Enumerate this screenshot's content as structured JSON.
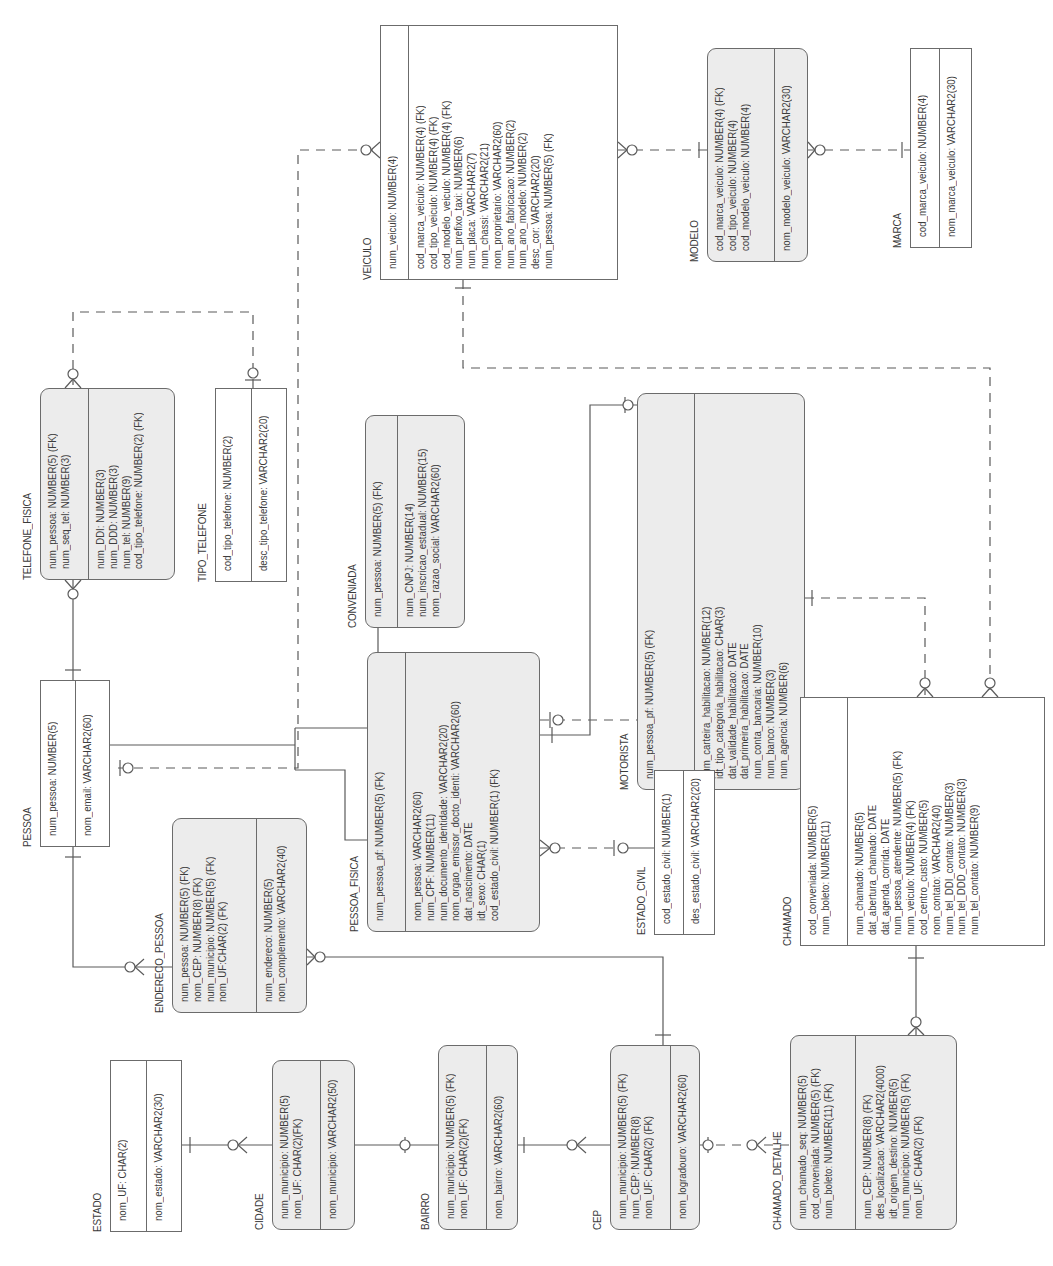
{
  "diagram": {
    "type": "entity-relationship",
    "orientation": "rotated-90-ccw",
    "colors": {
      "line": "#5a5a5a",
      "dependent_fill": "#ececec",
      "independent_fill": "#ffffff",
      "text": "#3a3a3a"
    }
  },
  "entities": {
    "veiculo": {
      "name": "VEICULO",
      "pk": [
        "num_veiculo: NUMBER(4)"
      ],
      "attrs": [
        "cod_marca_veiculo: NUMBER(4) (FK)",
        "cod_tipo_veiculo: NUMBER(4) (FK)",
        "cod_modelo_veiculo: NUMBER(4) (FK)",
        "num_prefixo_taxi: NUMBER(6)",
        "num_placa: VARCHAR2(7)",
        "num_chassi: VARCHAR2(21)",
        "nom_proprietario: VARCHAR2(60)",
        "num_ano_fabricacao: NUMBER(2)",
        "num_ano_modelo: NUMBER(2)",
        "desc_cor: VARCHAR2(20)",
        "num_pessoa: NUMBER(5) (FK)"
      ]
    },
    "modelo": {
      "name": "MODELO",
      "pk": [
        "cod_marca_veiculo: NUMBER(4) (FK)",
        "cod_tipo_veiculo: NUMBER(4)",
        "cod_modelo_veiculo: NUMBER(4)"
      ],
      "attrs": [
        "nom_modelo_veiculo: VARCHAR2(30)"
      ]
    },
    "marca": {
      "name": "MARCA",
      "pk": [
        "cod_marca_veiculo: NUMBER(4)"
      ],
      "attrs": [
        "nom_marca_veiculo: VARCHAR2(30)"
      ]
    },
    "telefone_fisica": {
      "name": "TELEFONE_FISICA",
      "pk": [
        "num_pessoa: NUMBER(5) (FK)",
        "num_seq_tel: NUMBER(3)"
      ],
      "attrs": [
        "num_DDI: NUMBER(3)",
        "num_DDD: NUMBER(3)",
        "num_tel: NUMBER(9)",
        "cod_tipo_telefone: NUMBER(2) (FK)"
      ]
    },
    "tipo_telefone": {
      "name": "TIPO_TELEFONE",
      "pk": [
        "cod_tipo_telefone: NUMBER(2)"
      ],
      "attrs": [
        "desc_tipo_telefone: VARCHAR2(20)"
      ]
    },
    "conveniada": {
      "name": "CONVENIADA",
      "pk": [
        "num_pessoa: NUMBER(5) (FK)"
      ],
      "attrs": [
        "num_CNPJ: NUMBER(14)",
        "num_inscricao_estadual: NUMBER(15)",
        "nom_razao_social: VARCHAR2(60)"
      ]
    },
    "motorista": {
      "name": "MOTORISTA",
      "pk": [
        "num_pessoa_pf: NUMBER(5) (FK)"
      ],
      "attrs": [
        "num_carteira_habilitacao: NUMBER(12)",
        "idt_tipo_categoria_habilitacao: CHAR(3)",
        "dat_validade_habilitacao: DATE",
        "dat_primeira_habilitacao: DATE",
        "num_conta_bancaria: NUMBER(10)",
        "num_banco: NUMBER(3)",
        "num_agencia: NUMBER(6)"
      ]
    },
    "pessoa": {
      "name": "PESSOA",
      "pk": [
        "num_pessoa: NUMBER(5)"
      ],
      "attrs": [
        "nom_email: VARCHAR2(60)"
      ]
    },
    "pessoa_fisica": {
      "name": "PESSOA_FISICA",
      "pk": [
        "num_pessoa_pf: NUMBER(5) (FK)"
      ],
      "attrs": [
        "nom_pessoa: VARCHAR2(60)",
        "num_CPF: NUMBER(11)",
        "num_documento_identidade: VARCHAR2(20)",
        "nom_orgao_emissor_docto_identi: VARCHAR2(60)",
        "dat_nascimento: DATE",
        "idt_sexo: CHAR(1)",
        "cod_estado_civil: NUMBER(1) (FK)"
      ]
    },
    "estado_civil": {
      "name": "ESTADO_CIVIL",
      "pk": [
        "cod_estado_civil: NUMBER(1)"
      ],
      "attrs": [
        "des_estado_civil: VARCHAR2(20)"
      ]
    },
    "chamado": {
      "name": "CHAMADO",
      "pk": [
        "cod_conveniada: NUMBER(5)",
        "num_boleto: NUMBER(11)"
      ],
      "attrs": [
        "num_chamado: NUMBER(5)",
        "dat_abertura_chamado: DATE",
        "dat_agenda_corrida: DATE",
        "num_pessoa_atendente: NUMBER(5) (FK)",
        "num_veiculo: NUMBER(4) (FK)",
        "cod_centro_custo: NUMBER(5)",
        "nom_contato: VARCHAR2(40)",
        "num_tel_DDI_contato: NUMBER(3)",
        "num_tel_DDD_contato: NUMBER(3)",
        "num_tel_contato: NUMBER(9)"
      ]
    },
    "endereco_pessoa": {
      "name": "ENDERECO_PESSOA",
      "pk": [
        "num_pessoa: NUMBER(5) (FK)",
        "nom_CEP: NUMBER(8) (FK)",
        "num_municipio: NUMBER(5) (FK)",
        "nom_UF:CHAR(2) (FK)"
      ],
      "attrs": [
        "num_endereco: NUMBER(5)",
        "nom_complemento: VARCHAR2(40)"
      ]
    },
    "estado": {
      "name": "ESTADO",
      "pk": [
        "nom_UF: CHAR(2)"
      ],
      "attrs": [
        "nom_estado: VARCHAR2(30)"
      ]
    },
    "cidade": {
      "name": "CIDADE",
      "pk": [
        "num_municipio: NUMBER(5)",
        "nom_UF: CHAR(2)(FK)"
      ],
      "attrs": [
        "nom_municipio: VARCHAR2(50)"
      ]
    },
    "bairro": {
      "name": "BAIRRO",
      "pk": [
        "num_municipio: NUMBER(5) (FK)",
        "nom_UF: CHAR(2)(FK)"
      ],
      "attrs": [
        "nom_bairro: VARCHAR2(60)"
      ]
    },
    "cep": {
      "name": "CEP",
      "pk": [
        "num_municipio: NUMBER(5) (FK)",
        "num_CEP: NUMBER(8)",
        "nom_UF: CHAR(2) (FK)"
      ],
      "attrs": [
        "nom_logradouro: VARCHAR2(60)"
      ]
    },
    "chamado_detalhe": {
      "name": "CHAMADO_DETALHE",
      "pk": [
        "num_chamado_seq: NUMBER(5)",
        "cod_conveniada: NUMBER(5) (FK)",
        "num_boleto: NUMBER(11) (FK)"
      ],
      "attrs": [
        "num_CEP: NUMBER(8) (FK)",
        "des_localizacao: VARCHAR2(4000)",
        "idt_origem_destino: NUMBER(5)",
        "num_municipio: NUMBER(5) (FK)",
        "nom_UF: CHAR(2) (FK)"
      ]
    }
  },
  "relationships": [
    {
      "from": "MARCA",
      "to": "MODELO",
      "style": "non-identifying"
    },
    {
      "from": "MODELO",
      "to": "VEICULO",
      "style": "non-identifying"
    },
    {
      "from": "PESSOA",
      "to": "VEICULO",
      "style": "non-identifying"
    },
    {
      "from": "TIPO_TELEFONE",
      "to": "TELEFONE_FISICA",
      "style": "non-identifying"
    },
    {
      "from": "PESSOA",
      "to": "TELEFONE_FISICA",
      "style": "identifying"
    },
    {
      "from": "PESSOA",
      "to": "PESSOA_FISICA",
      "style": "identifying-subtype"
    },
    {
      "from": "PESSOA",
      "to": "CONVENIADA",
      "style": "identifying-subtype"
    },
    {
      "from": "PESSOA_FISICA",
      "to": "MOTORISTA",
      "style": "identifying"
    },
    {
      "from": "PESSOA_FISICA",
      "to": "CHAMADO",
      "style": "non-identifying"
    },
    {
      "from": "MOTORISTA",
      "to": "CHAMADO",
      "style": "non-identifying"
    },
    {
      "from": "VEICULO",
      "to": "CHAMADO",
      "style": "non-identifying"
    },
    {
      "from": "ESTADO_CIVIL",
      "to": "PESSOA_FISICA",
      "style": "non-identifying"
    },
    {
      "from": "PESSOA",
      "to": "ENDERECO_PESSOA",
      "style": "identifying"
    },
    {
      "from": "CEP",
      "to": "ENDERECO_PESSOA",
      "style": "identifying"
    },
    {
      "from": "ESTADO",
      "to": "CIDADE",
      "style": "identifying"
    },
    {
      "from": "CIDADE",
      "to": "BAIRRO",
      "style": "identifying"
    },
    {
      "from": "BAIRRO",
      "to": "CEP",
      "style": "identifying"
    },
    {
      "from": "CEP",
      "to": "CHAMADO_DETALHE",
      "style": "non-identifying"
    },
    {
      "from": "CHAMADO",
      "to": "CHAMADO_DETALHE",
      "style": "identifying"
    }
  ]
}
